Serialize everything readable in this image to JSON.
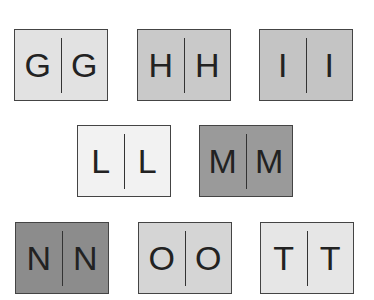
{
  "tiles": [
    {
      "letter": "G",
      "left": 14,
      "top": 29,
      "color": "#e2e2e2"
    },
    {
      "letter": "H",
      "left": 137,
      "top": 29,
      "color": "#c9c9c9"
    },
    {
      "letter": "I",
      "left": 259,
      "top": 29,
      "color": "#c4c4c4"
    },
    {
      "letter": "L",
      "left": 77,
      "top": 125,
      "color": "#f2f2f2"
    },
    {
      "letter": "M",
      "left": 199,
      "top": 125,
      "color": "#9a9a9a"
    },
    {
      "letter": "N",
      "left": 15,
      "top": 222,
      "color": "#8c8c8c"
    },
    {
      "letter": "O",
      "left": 138,
      "top": 222,
      "color": "#d5d5d5"
    },
    {
      "letter": "T",
      "left": 260,
      "top": 222,
      "color": "#e6e6e6"
    }
  ]
}
